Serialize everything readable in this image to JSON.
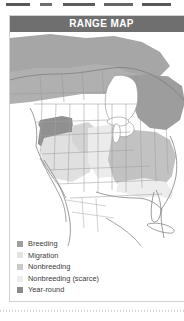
{
  "card": {
    "header_title": "RANGE MAP",
    "header_bg": "#6f6f6f",
    "header_text_color": "#ffffff",
    "border_color": "#d2d2d2"
  },
  "map": {
    "region": "North America",
    "ocean_color": "#ffffff",
    "land_color": "#f4f4f4",
    "border_line_color": "#8e8e8e",
    "state_line_color": "#a8a8a8",
    "labels": []
  },
  "legend": {
    "items": [
      {
        "label": "Breeding",
        "color": "#9e9e9e"
      },
      {
        "label": "Migration",
        "color": "#e3e3e3"
      },
      {
        "label": "Nonbreeding",
        "color": "#c9c9c9"
      },
      {
        "label": "Nonbreeding (scarce)",
        "color": "#ededed"
      },
      {
        "label": "Year-round",
        "color": "#8c8c8c"
      }
    ]
  }
}
